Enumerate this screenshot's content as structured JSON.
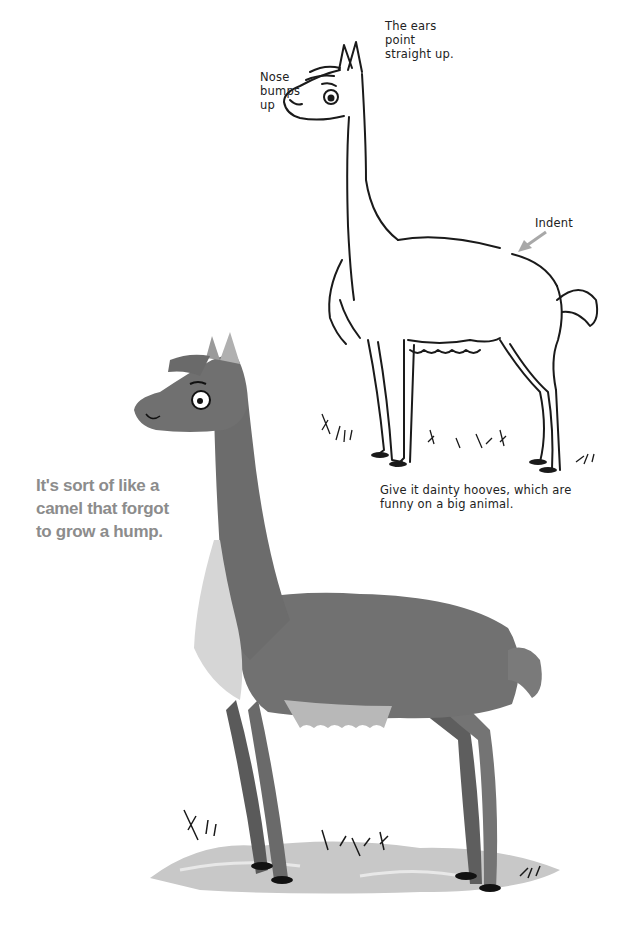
{
  "page": {
    "type": "drawing-instruction-page"
  },
  "sketch_annotations": {
    "nose": [
      "Nose",
      "bumps",
      "up"
    ],
    "ears": [
      "The ears",
      "point",
      "straight up."
    ],
    "indent": "Indent",
    "hooves": [
      "Give it dainty hooves, which are",
      "funny on a big animal."
    ]
  },
  "callout": {
    "lines": [
      "It's sort of like a",
      "camel that forgot",
      "to grow a hump."
    ],
    "color": "#8c8c8c"
  },
  "illustrations": {
    "line_sketch": {
      "name": "llama line drawing",
      "stroke_color": "#1a1a1a"
    },
    "shaded": {
      "name": "shaded gray llama",
      "body_color": "#6f6f6f",
      "chest_fur_color": "#d6d6d6",
      "ground_color": "#c8c8c8"
    },
    "arrow_color": "#a8a8a8"
  }
}
